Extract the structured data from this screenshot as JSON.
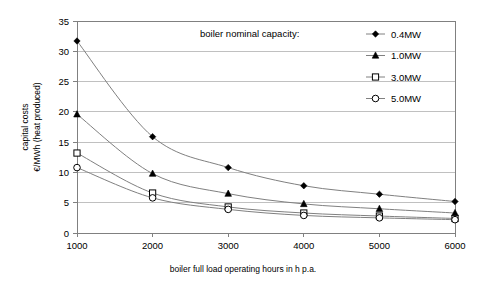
{
  "chart_data": {
    "type": "line",
    "title": "",
    "xlabel": "boiler full load operating hours in h p.a.",
    "ylabel": "capital costs\n€/MWh (heat produced)",
    "ylabel_line1": "capital costs",
    "ylabel_line2": "€/MWh (heat produced)",
    "legend_title": "boiler nominal capacity:",
    "legend_position": "inside-top-right",
    "grid": "horizontal",
    "x": [
      1000,
      2000,
      3000,
      4000,
      5000,
      6000
    ],
    "xtick_labels": [
      "1000",
      "2000",
      "3000",
      "4000",
      "5000",
      "6000"
    ],
    "xlim": [
      1000,
      6000
    ],
    "ylim": [
      0,
      35
    ],
    "ytick_labels": [
      "0",
      "5",
      "10",
      "15",
      "20",
      "25",
      "30",
      "35"
    ],
    "yticks": [
      0,
      5,
      10,
      15,
      20,
      25,
      30,
      35
    ],
    "series": [
      {
        "name": "0.4MW",
        "marker": "filled-diamond",
        "values": [
          31.7,
          15.9,
          10.8,
          7.8,
          6.4,
          5.2
        ]
      },
      {
        "name": "1.0MW",
        "marker": "filled-triangle",
        "values": [
          19.6,
          9.8,
          6.5,
          4.8,
          4.0,
          3.3
        ]
      },
      {
        "name": "3.0MW",
        "marker": "open-square",
        "values": [
          13.2,
          6.6,
          4.3,
          3.3,
          2.8,
          2.4
        ]
      },
      {
        "name": "5.0MW",
        "marker": "open-circle",
        "values": [
          10.8,
          5.8,
          3.9,
          2.9,
          2.5,
          2.2
        ]
      }
    ],
    "colors": {
      "line": "#808080",
      "marker": "#000000",
      "grid": "#c0c0c0",
      "axis": "#808080",
      "background": "#ffffff"
    }
  }
}
